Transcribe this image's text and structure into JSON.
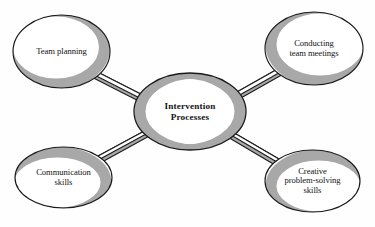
{
  "diagram": {
    "type": "hub-and-spoke",
    "title": "Intervention Processes",
    "center": {
      "id": "intervention-processes",
      "lines": [
        "Intervention",
        "Processes"
      ],
      "shape": "ellipse",
      "bold": true
    },
    "nodes": [
      {
        "id": "team-planning",
        "position": "top-left",
        "lines": [
          "Team planning"
        ],
        "shape": "ellipse",
        "shadow_side": "lower-right"
      },
      {
        "id": "conducting-team-meetings",
        "position": "top-right",
        "lines": [
          "Conducting",
          "team meetings"
        ],
        "shape": "ellipse",
        "shadow_side": "lower-left"
      },
      {
        "id": "communication-skills",
        "position": "bottom-left",
        "lines": [
          "Communication",
          "skills"
        ],
        "shape": "ellipse",
        "shadow_side": "upper-right"
      },
      {
        "id": "creative-problem-solving-skills",
        "position": "bottom-right",
        "lines": [
          "Creative",
          "problem-solving",
          "skills"
        ],
        "shape": "ellipse",
        "shadow_side": "upper-left"
      }
    ],
    "connectors": [
      {
        "id": "connector-team-planning",
        "from": "intervention-processes",
        "to": "team-planning",
        "style": "ribbon"
      },
      {
        "id": "connector-conducting",
        "from": "intervention-processes",
        "to": "conducting-team-meetings",
        "style": "ribbon"
      },
      {
        "id": "connector-communication",
        "from": "intervention-processes",
        "to": "communication-skills",
        "style": "ribbon"
      },
      {
        "id": "connector-creative",
        "from": "intervention-processes",
        "to": "creative-problem-solving-skills",
        "style": "ribbon"
      }
    ],
    "colors": {
      "background": "#fefefe",
      "node_fill": "#ffffff",
      "outline": "#1a1a1a",
      "shadow": "#a8a8a8",
      "text": "#121212"
    }
  }
}
